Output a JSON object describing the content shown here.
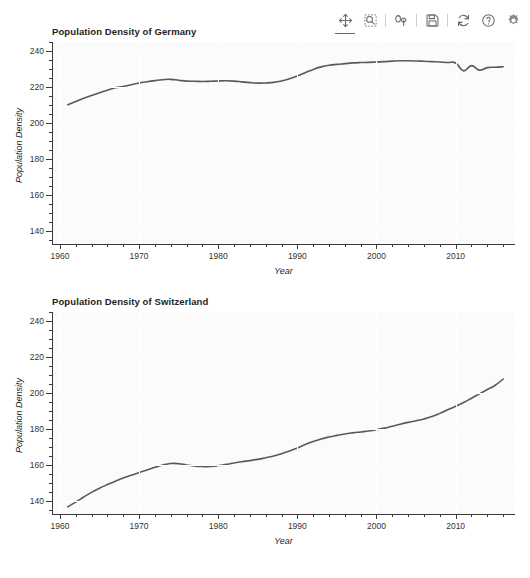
{
  "toolbar": {
    "buttons": [
      {
        "name": "pan-move-icon",
        "label": "Pan / Move",
        "active": true
      },
      {
        "name": "zoom-region-icon",
        "label": "Zoom to region",
        "active": false
      },
      {
        "name": "axis-options-icon",
        "label": "Axis options",
        "active": false
      },
      {
        "name": "save-icon",
        "label": "Save",
        "active": false
      },
      {
        "name": "refresh-icon",
        "label": "Refresh",
        "active": false
      },
      {
        "name": "help-icon",
        "label": "Help",
        "active": false
      },
      {
        "name": "settings-gear-icon",
        "label": "Settings",
        "active": false
      }
    ]
  },
  "colors": {
    "line": "#595959",
    "plot_background": "#fbfbfc",
    "gridline": "#ffffff",
    "axis": "#3a3a3a",
    "text": "#1d1d1d"
  },
  "chart_data": [
    {
      "type": "line",
      "title": "Population Density of Germany",
      "xlabel": "Year",
      "ylabel": "Population Density",
      "xlim": [
        1959,
        2017.5
      ],
      "ylim": [
        133,
        245
      ],
      "xticks": [
        1960,
        1970,
        1980,
        1990,
        2000,
        2010
      ],
      "xticklabels": [
        "1960",
        "1970",
        "1980",
        "1990",
        "2000",
        "2010"
      ],
      "xminor_step": 2,
      "yticks": [
        140,
        160,
        180,
        200,
        220,
        240
      ],
      "yticklabels": [
        "140",
        "160",
        "180",
        "200",
        "220",
        "240"
      ],
      "yminor_step": 5,
      "grid": true,
      "legend": "none",
      "x": [
        1961,
        1962,
        1963,
        1964,
        1965,
        1966,
        1967,
        1968,
        1969,
        1970,
        1971,
        1972,
        1973,
        1974,
        1975,
        1976,
        1977,
        1978,
        1979,
        1980,
        1981,
        1982,
        1983,
        1984,
        1985,
        1986,
        1987,
        1988,
        1989,
        1990,
        1991,
        1992,
        1993,
        1994,
        1995,
        1996,
        1997,
        1998,
        1999,
        2000,
        2001,
        2002,
        2003,
        2004,
        2005,
        2006,
        2007,
        2008,
        2009,
        2010,
        2011,
        2012,
        2013,
        2014,
        2015,
        2016
      ],
      "values": [
        210.2,
        212.0,
        213.8,
        215.3,
        216.9,
        218.3,
        219.6,
        220.3,
        221.3,
        222.3,
        223.0,
        223.6,
        224.1,
        224.3,
        223.8,
        223.3,
        223.2,
        223.1,
        223.2,
        223.4,
        223.5,
        223.3,
        222.9,
        222.5,
        222.2,
        222.3,
        222.6,
        223.4,
        224.6,
        226.2,
        228.0,
        229.8,
        231.2,
        232.1,
        232.6,
        233.0,
        233.4,
        233.6,
        233.7,
        233.9,
        234.1,
        234.4,
        234.6,
        234.6,
        234.5,
        234.3,
        234.1,
        233.9,
        233.6,
        233.4,
        229.0,
        231.9,
        229.4,
        230.8,
        231.0,
        231.3
      ]
    },
    {
      "type": "line",
      "title": "Population Density of Switzerland",
      "xlabel": "Year",
      "ylabel": "Population Density",
      "xlim": [
        1959,
        2017.5
      ],
      "ylim": [
        133,
        245
      ],
      "xticks": [
        1960,
        1970,
        1980,
        1990,
        2000,
        2010
      ],
      "xticklabels": [
        "1960",
        "1970",
        "1980",
        "1990",
        "2000",
        "2010"
      ],
      "xminor_step": 2,
      "yticks": [
        140,
        160,
        180,
        200,
        220,
        240
      ],
      "yticklabels": [
        "140",
        "160",
        "180",
        "200",
        "220",
        "240"
      ],
      "yminor_step": 5,
      "grid": true,
      "legend": "none",
      "x": [
        1961,
        1962,
        1963,
        1964,
        1965,
        1966,
        1967,
        1968,
        1969,
        1970,
        1971,
        1972,
        1973,
        1974,
        1975,
        1976,
        1977,
        1978,
        1979,
        1980,
        1981,
        1982,
        1983,
        1984,
        1985,
        1986,
        1987,
        1988,
        1989,
        1990,
        1991,
        1992,
        1993,
        1994,
        1995,
        1996,
        1997,
        1998,
        1999,
        2000,
        2001,
        2002,
        2003,
        2004,
        2005,
        2006,
        2007,
        2008,
        2009,
        2010,
        2011,
        2012,
        2013,
        2014,
        2015,
        2016
      ],
      "values": [
        137.0,
        139.6,
        142.4,
        145.0,
        147.3,
        149.3,
        151.2,
        153.0,
        154.5,
        155.9,
        157.4,
        158.9,
        160.2,
        161.0,
        160.9,
        160.2,
        159.6,
        159.3,
        159.4,
        159.8,
        160.5,
        161.3,
        162.0,
        162.6,
        163.3,
        164.2,
        165.2,
        166.4,
        167.9,
        169.6,
        171.5,
        173.2,
        174.6,
        175.7,
        176.6,
        177.4,
        178.0,
        178.5,
        179.0,
        179.7,
        180.6,
        181.7,
        182.8,
        183.8,
        184.7,
        185.7,
        187.0,
        188.8,
        190.8,
        192.7,
        194.8,
        197.2,
        199.6,
        202.0,
        204.4,
        207.8
      ]
    }
  ]
}
